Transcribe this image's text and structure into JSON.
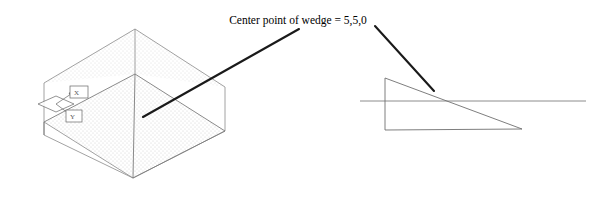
{
  "figure": {
    "name": "wedge-center-point-diagram",
    "background_color": "#ffffff",
    "width": 602,
    "height": 200
  },
  "annotation": {
    "label": "Center point of wedge = 5,5,0",
    "text_color": "#000000",
    "text_x": 298,
    "text_y": 24,
    "font_size": 11.5
  },
  "leaders": {
    "color": "#1a1a1a",
    "width": 2.1,
    "left": {
      "name": "leader-line-to-isometric-wedge",
      "x1": 299,
      "y1": 29,
      "x2": 143,
      "y2": 117
    },
    "right": {
      "name": "leader-line-to-profile-wedge",
      "x1": 375,
      "y1": 26,
      "x2": 434,
      "y2": 91
    }
  },
  "isometric_wedge": {
    "name": "isometric-wedge-view",
    "stroke_color": "#8a8a8a",
    "stroke_width": 0.8,
    "fill_color": "#fbfbfb",
    "stipple_color": "#cfcfcf",
    "vertices": {
      "top_apex": [
        135,
        29
      ],
      "mid_apex": [
        135,
        74
      ],
      "bottom_apex": [
        133,
        178
      ],
      "right": [
        225,
        131
      ],
      "left_top": [
        44,
        83
      ],
      "left_bottom": [
        44,
        135
      ],
      "back_left_top": [
        44,
        83
      ],
      "inner_left": [
        61,
        105
      ]
    },
    "inclined_face": [
      [
        135,
        74
      ],
      [
        225,
        131
      ],
      [
        133,
        178
      ],
      [
        44,
        122
      ]
    ],
    "outline_polygon": [
      [
        44,
        83
      ],
      [
        135,
        29
      ],
      [
        225,
        87
      ],
      [
        225,
        131
      ],
      [
        133,
        178
      ],
      [
        44,
        135
      ]
    ]
  },
  "ucs_icon": {
    "name": "ucs-axis-icon",
    "stroke_color": "#6f6f6f",
    "origin": [
      56,
      104
    ],
    "x_label": "X",
    "y_label": "Y",
    "x_box": [
      70,
      88,
      18,
      12
    ],
    "y_box": [
      66,
      110,
      16,
      12
    ]
  },
  "profile_wedge": {
    "name": "profile-wedge-view",
    "stroke_color": "#6f6f6f",
    "stroke_width": 0.9,
    "triangle": [
      [
        385,
        78
      ],
      [
        385,
        130
      ],
      [
        522,
        129
      ]
    ],
    "horizontal_line": {
      "name": "construction-horizontal-line",
      "x1": 360,
      "y1": 101,
      "x2": 586,
      "y2": 101
    }
  }
}
